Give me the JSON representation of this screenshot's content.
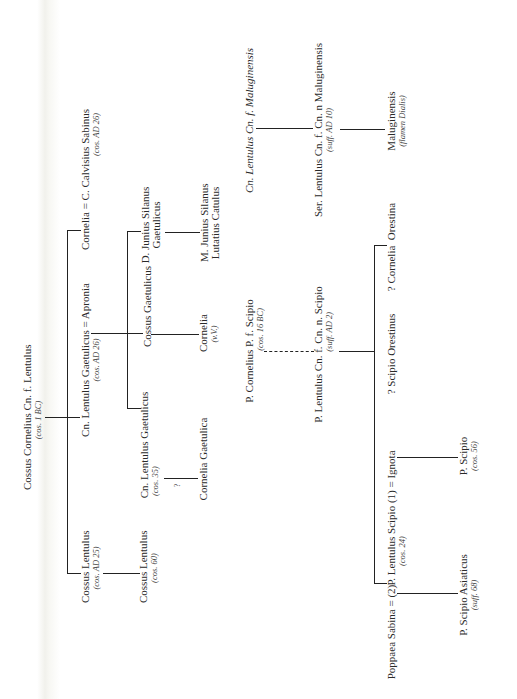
{
  "diagram": {
    "type": "family-tree",
    "orientation": "rotated-90-ccw",
    "line_color": "#222222",
    "nodes": {
      "root": {
        "name": "Cossus Cornelius Cn. f. Lentulus",
        "note": "(cos. 1 BC)"
      },
      "cossus_lentulus_25": {
        "name": "Cossus Lentulus",
        "note": "(cos. AD 25)"
      },
      "gaetulicus_26": {
        "name": "Cn. Lentulus Gaetulicus = Apronia",
        "note": "(cos. AD 26)"
      },
      "cornelia_calvisius": {
        "name": "Cornelia = C. Calvisius Sabinus",
        "note": "(cos. AD 26)"
      },
      "cossus_lentulus_60": {
        "name": "Cossus Lentulus",
        "note": "(cos. 60)"
      },
      "gaetulicus_35": {
        "name": "Cn. Lentulus Gaetulicus",
        "note": "(cos. 35)"
      },
      "cossus_gaetulicus": {
        "name": "Cossus Gaetulicus"
      },
      "d_junius": {
        "name_line1": "D. Junius Silanus",
        "name_line2": "Gaetulicus"
      },
      "cornelia_gaetulica": {
        "name": "Cornelia Gaetulica"
      },
      "uncertain_mark": "?",
      "cornelia_vv": {
        "name": "Cornelia",
        "note": "(v.V.)"
      },
      "m_junius": {
        "name_line1": "M. Junius Silanus",
        "name_line2": "Lutatius Catulus"
      },
      "cn_maluginensis": {
        "name": "Cn. Lentulus Cn. f. Maluginensis"
      },
      "p_cornelius_scipio": {
        "name": "P. Cornelius P. f. Scipio",
        "note": "(cos. 16 BC)"
      },
      "ser_maluginensis": {
        "name": "Ser. Lentulus Cn. f. Cn. n Maluginensis",
        "note": "(suff. AD 10)"
      },
      "p_lentulus_scipio_2": {
        "name": "P. Lentulus Cn. f. Cn. n. Scipio",
        "note": "(suff. AD 2)"
      },
      "maluginensis_flamen": {
        "name": "Maluginensis",
        "note": "(flamen Dialis)"
      },
      "cornelia_orestina": {
        "name": "? Cornelia  Orestina"
      },
      "scipio_orestinus": {
        "name": "? Scipio Orestinus"
      },
      "p_lentulus_scipio_24": {
        "name": "P. Lentulus Scipio (1) = Ignota",
        "note": "(cos. 24)"
      },
      "poppaea": {
        "name": "Poppaea Sabina = (2)"
      },
      "p_scipio_56": {
        "name": "P. Scipio",
        "note": "(cos. 56)"
      },
      "p_scipio_asiaticus": {
        "name": "P. Scipio Asiaticus",
        "note": "(suff. 68)"
      }
    }
  }
}
